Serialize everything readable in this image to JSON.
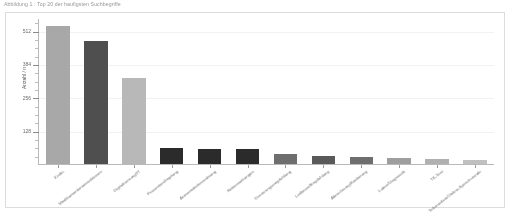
{
  "document": {
    "heading": "Abbildung 1 : Top 20 der haufigsten Suchbegriffe"
  },
  "figure": {
    "panel_name": "bar-chart-figure",
    "background": "#ffffff",
    "border_color": "#dcdcdc"
  },
  "chart_data": {
    "type": "bar",
    "title": "",
    "xlabel": "",
    "ylabel": "Anzahl / n",
    "ylim": [
      0,
      560
    ],
    "grid": true,
    "legend": "none",
    "y_major_ticks": [
      128,
      256,
      384,
      512
    ],
    "y_tick_labels": [
      "128",
      "256",
      "384",
      "512"
    ],
    "categories": [
      "Krebs",
      "Medikamenteninteraktionen",
      "Digitalisierung/IT",
      "Pravention/Impfung",
      "Arzneimittelverordnung",
      "Nebenwirkungen",
      "Dosierungsempfehlung",
      "Leitlinien/Empfehlung",
      "Abrechnung/Kodierung",
      "Labor/Diagnostik",
      "TK-Test",
      "Telemedizin/Online-Sprechstunde"
    ],
    "values": [
      530,
      470,
      330,
      60,
      58,
      57,
      38,
      30,
      26,
      24,
      20,
      16
    ],
    "bar_colors": [
      "#a8a8a8",
      "#4f4f4f",
      "#b8b8b8",
      "#2b2b2b",
      "#2b2b2b",
      "#2b2b2b",
      "#6e6e6e",
      "#5a5a5a",
      "#6e6e6e",
      "#9e9e9e",
      "#b0b0b0",
      "#c0c0c0"
    ],
    "accent_color": "#4f4f4f",
    "axis_color": "#b9b9b9",
    "gridline_color": "#f2f2f2",
    "tick_label_color": "#6a6a6a"
  }
}
